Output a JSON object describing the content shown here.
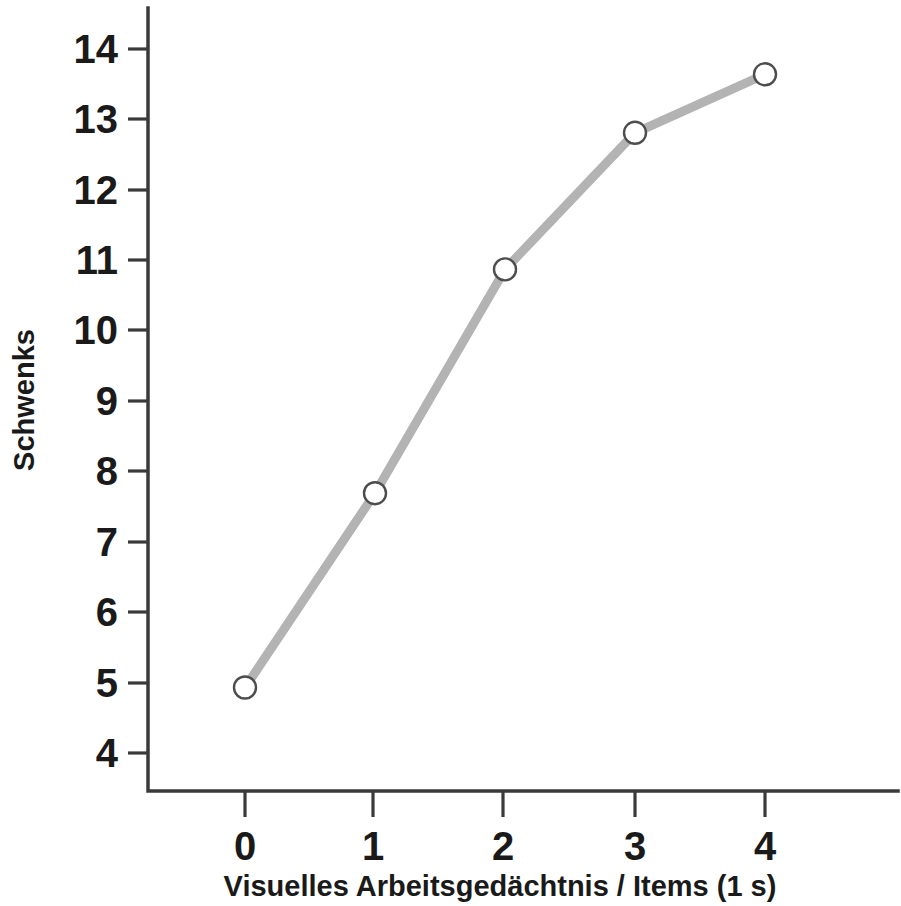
{
  "chart_data": {
    "type": "line",
    "title": "",
    "subtitle": "",
    "xlabel": "Visuelles Arbeitsgedächtnis / Items (1 s)",
    "ylabel": "Schwenks",
    "x": [
      0,
      1,
      2,
      3,
      4
    ],
    "values": [
      4.93,
      7.69,
      10.87,
      12.81,
      13.64
    ],
    "xticklabels": [
      "0",
      "1",
      "2",
      "3",
      "4"
    ],
    "yticklabels": [
      "4",
      "5",
      "6",
      "7",
      "8",
      "9",
      "10",
      "11",
      "12",
      "13",
      "14"
    ],
    "yticks": [
      4,
      5,
      6,
      7,
      8,
      9,
      10,
      11,
      12,
      13,
      14
    ],
    "xlim": [
      -0.35,
      4.6
    ],
    "ylim": [
      3.5,
      14.4
    ],
    "grid": false,
    "legend": null,
    "series": [
      {
        "name": "Schwenks",
        "values": [
          4.93,
          7.69,
          10.87,
          12.81,
          13.64
        ],
        "line_color": "#b3b3b3",
        "line_width": 9,
        "marker": "open-circle",
        "marker_face_color": "#ffffff",
        "marker_edge_color": "#4d4d4d",
        "marker_size": 22
      }
    ],
    "annotations": []
  },
  "figure": {
    "background_color": "#ffffff",
    "axis_color": "#3a3a3a",
    "text_color": "#1a1a1a"
  }
}
